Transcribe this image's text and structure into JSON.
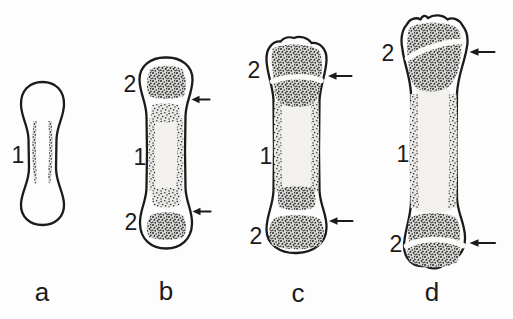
{
  "figure": {
    "type": "anatomical-line-drawing"
  },
  "colors": {
    "ink": "#1b1b1b",
    "paper": "#fdfdfd",
    "stipple_dot": "#161616",
    "stipple_dense_bg": "#dbdad7",
    "stipple_medium_bg": "#e9e8e4",
    "shaft_fill": "#f2f1ee"
  },
  "icons": {
    "growth_plate_arrow": "left-arrow"
  },
  "stages": [
    {
      "letter": "a",
      "labels": {
        "primary": "1"
      }
    },
    {
      "letter": "b",
      "labels": {
        "primary": "1",
        "secondary_top": "2",
        "secondary_bottom": "2"
      }
    },
    {
      "letter": "c",
      "labels": {
        "primary": "1",
        "secondary_top": "2",
        "secondary_bottom": "2"
      }
    },
    {
      "letter": "d",
      "labels": {
        "primary": "1",
        "secondary_top": "2",
        "secondary_bottom": "2"
      }
    }
  ]
}
